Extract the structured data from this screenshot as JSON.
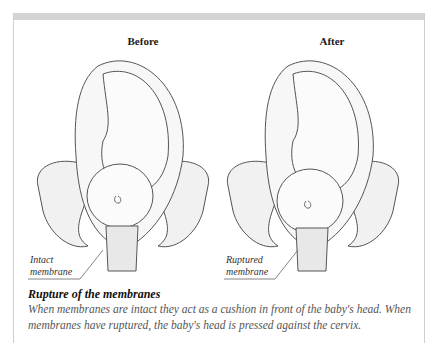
{
  "figure": {
    "panels": [
      {
        "title": "Before",
        "label_line1": "Intact",
        "label_line2": "membrane"
      },
      {
        "title": "After",
        "label_line1": "Ruptured",
        "label_line2": "membrane"
      }
    ],
    "caption": {
      "title": "Rupture of the membranes",
      "body": "When membranes are intact they act as a cushion in front of the baby's head. When membranes have ruptured, the baby's head is pressed against the cervix."
    }
  }
}
